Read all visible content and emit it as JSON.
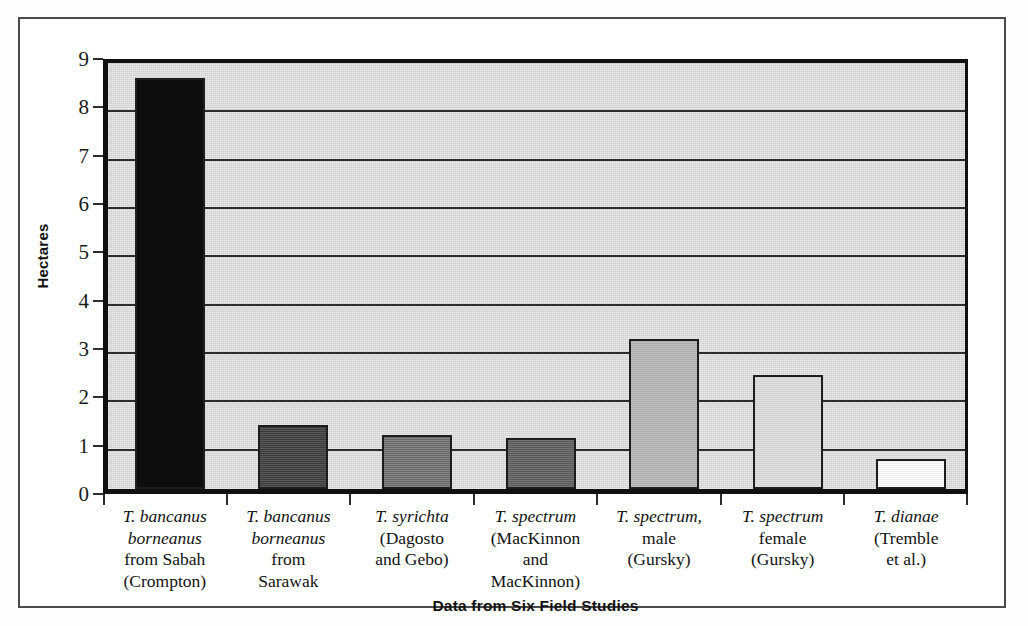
{
  "chart_data": {
    "type": "bar",
    "title": "",
    "xlabel": "Data from Six Field Studies",
    "ylabel": "Hectares",
    "ylim": [
      0,
      9
    ],
    "ytick_labels": [
      "0",
      "1",
      "2",
      "3",
      "4",
      "5",
      "6",
      "7",
      "8",
      "9"
    ],
    "yticks": [
      0,
      1,
      2,
      3,
      4,
      5,
      6,
      7,
      8,
      9
    ],
    "grid": "horizontal",
    "legend": "none",
    "categories": [
      "T. bancanus borneanus from Sabah (Crompton)",
      "T. bancanus borneanus from Sarawak",
      "T. syrichta (Dagosto and Gebo)",
      "T. spectrum (MacKinnon and MacKinnon)",
      "T. spectrum, male (Gursky)",
      "T. spectrum female (Gursky)",
      "T. dianae (Tremble et al.)"
    ],
    "values": [
      8.5,
      1.33,
      1.12,
      1.06,
      3.1,
      2.35,
      0.63
    ],
    "bar_colors": [
      "#0d0d0d",
      "#3b3b3b",
      "#6e6e6e",
      "#5c5c5c",
      "#b4b4b4",
      "#dcdcdc",
      "#fbfbfb"
    ],
    "bar_edge_color": "#1d1d1d",
    "plot_background": "#d9d9d9",
    "gridline_color": "#2c2c2c"
  },
  "axis": {
    "y_label": "Hectares",
    "x_label": "Data from Six Field Studies"
  },
  "categories_lines": [
    {
      "lines": [
        {
          "text": "T. bancanus",
          "italic": true
        },
        {
          "text": "borneanus",
          "italic": true
        },
        {
          "text": "from Sabah",
          "italic": false
        },
        {
          "text": "(Crompton)",
          "italic": false
        }
      ]
    },
    {
      "lines": [
        {
          "text": "T. bancanus",
          "italic": true
        },
        {
          "text": "borneanus",
          "italic": true
        },
        {
          "text": "from",
          "italic": false
        },
        {
          "text": "Sarawak",
          "italic": false
        }
      ]
    },
    {
      "lines": [
        {
          "text": "T. syrichta",
          "italic": true
        },
        {
          "text": "(Dagosto",
          "italic": false
        },
        {
          "text": "and Gebo)",
          "italic": false
        }
      ]
    },
    {
      "lines": [
        {
          "text": "T. spectrum",
          "italic": true
        },
        {
          "text": "(MacKinnon",
          "italic": false
        },
        {
          "text": "and",
          "italic": false
        },
        {
          "text": "MacKinnon)",
          "italic": false
        }
      ]
    },
    {
      "lines": [
        {
          "text": "T. spectrum,",
          "italic": true
        },
        {
          "text": "male",
          "italic": false
        },
        {
          "text": "(Gursky)",
          "italic": false
        }
      ]
    },
    {
      "lines": [
        {
          "text": "T. spectrum",
          "italic": true
        },
        {
          "text": "female",
          "italic": false
        },
        {
          "text": "(Gursky)",
          "italic": false
        }
      ]
    },
    {
      "lines": [
        {
          "text": "T. dianae",
          "italic": true
        },
        {
          "text": "(Tremble",
          "italic": false
        },
        {
          "text": "et al.)",
          "italic": false
        }
      ]
    }
  ]
}
